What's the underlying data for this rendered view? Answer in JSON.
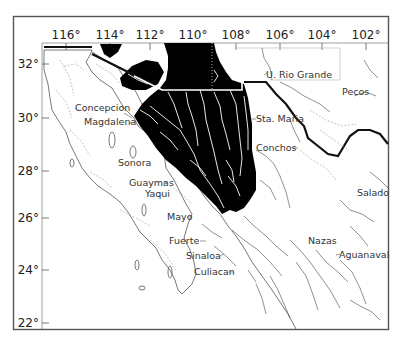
{
  "map": {
    "longitude_ticks": [
      {
        "label": "116°",
        "x": 66
      },
      {
        "label": "114°",
        "x": 110
      },
      {
        "label": "112°",
        "x": 150
      },
      {
        "label": "110°",
        "x": 193
      },
      {
        "label": "108°",
        "x": 236
      },
      {
        "label": "106°",
        "x": 280
      },
      {
        "label": "104°",
        "x": 322
      },
      {
        "label": "102°",
        "x": 366
      }
    ],
    "latitude_ticks": [
      {
        "label": "32°",
        "y": 64
      },
      {
        "label": "30°",
        "y": 118
      },
      {
        "label": "28°",
        "y": 171
      },
      {
        "label": "26°",
        "y": 218
      },
      {
        "label": "24°",
        "y": 270
      },
      {
        "label": "22°",
        "y": 323
      }
    ],
    "labels": {
      "u_rio_grande": "U. Rio Grande",
      "pecos": "Pecos",
      "concepcion": "Concepcion",
      "magdalena": "Magdalena",
      "sta_maria": "Sta. Maria",
      "conchos": "Conchos",
      "sonora": "Sonora",
      "guaymas": "Guaymas",
      "yaqui": "Yaqui",
      "salado": "Salado",
      "mayo": "Mayo",
      "fuerte": "Fuerte",
      "sinaloa": "Sinaloa",
      "nazas": "Nazas",
      "aguanaval": "Aguanaval",
      "culiacan": "Culiacan"
    },
    "colors": {
      "highlight_region": "#000000",
      "frame": "#555555",
      "border": "#111111",
      "background": "#ffffff"
    }
  }
}
